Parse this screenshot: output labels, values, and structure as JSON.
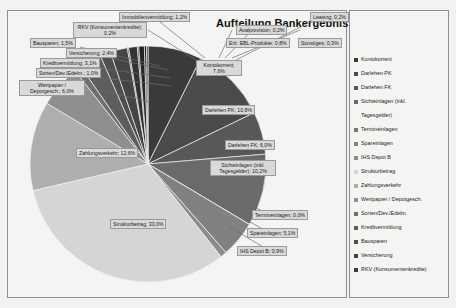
{
  "chart": {
    "title": "Aufteilung Bankergebnis"
  },
  "chart_data": {
    "type": "pie",
    "title": "Aufteilung Bankergebnis",
    "xlabel": "",
    "ylabel": "",
    "value_suffix": "%",
    "legend_position": "right",
    "grid": false,
    "categories": [
      "Kontokorrent",
      "Darlehen PK",
      "Darlehen FK",
      "Sichteinlagen (inkl. Tagesgelder)",
      "Termineinlagen",
      "Spareinlagen",
      "IHS Depot B",
      "Strukturbetrag",
      "Zahlungsverkehr",
      "Wertpapier / Depotgesch.",
      "Sorten/Dev./Edelm.",
      "Kreditvermittlung",
      "Bausparen",
      "Versicherung",
      "RKV (Konsumentenkredite)",
      "Immobilienvermittlung",
      "Avalprovision",
      "Erlr. EBL-Produkte",
      "Sonstiges",
      "Leasing"
    ],
    "values": [
      7.6,
      10.8,
      6.0,
      10.2,
      0.0,
      5.1,
      0.9,
      33.0,
      12.6,
      6.0,
      1.0,
      3.1,
      1.5,
      2.4,
      0.2,
      1.2,
      0.2,
      0.8,
      0.3,
      0.2
    ],
    "slice_colors": [
      "#3a3a3a",
      "#4a4a4a",
      "#585858",
      "#6a6a6a",
      "#787878",
      "#818181",
      "#8c8c8c",
      "#d5d5d5",
      "#aeaeae",
      "#8f8f8f",
      "#6f6f6f",
      "#5d5d5d",
      "#4f4f4f",
      "#454545",
      "#3d3d3d",
      "#333333",
      "#2c2c2c",
      "#262626",
      "#1f1f1f",
      "#1a1a1a"
    ]
  },
  "labels": [
    {
      "id": "immobilienvermittlung",
      "text": "Immobilienvermittlung; 1,2%"
    },
    {
      "id": "avalprovision",
      "text": "Avalprovision; 0,2%"
    },
    {
      "id": "leasing",
      "text": "Leasing; 0,2%"
    },
    {
      "id": "rkv",
      "text": "RKV (Konsumentenkredite);",
      "text2": "0,2%"
    },
    {
      "id": "erlr-ebl",
      "text": "Erlr. EBL-Produkte; 0,8%"
    },
    {
      "id": "sonstiges",
      "text": "Sonstiges; 0,3%"
    },
    {
      "id": "bausparen",
      "text": "Bausparen; 1,5%"
    },
    {
      "id": "versicherung",
      "text": "Versicherung; 2,4%"
    },
    {
      "id": "kreditvermittlung",
      "text": "Kreditvermittlung; 3,1%"
    },
    {
      "id": "sorten",
      "text": "Sorten/Dev./Edelm.; 1,0%"
    },
    {
      "id": "wertpapier",
      "text": "Wertpapier /",
      "text2": "Depotgesch.; 6,0%"
    },
    {
      "id": "kontokorrent",
      "text": "Kontokorrent;",
      "text2": "7,6%"
    },
    {
      "id": "darlehen-pk",
      "text": "Darlehen PK; 10,8%"
    },
    {
      "id": "darlehen-fk",
      "text": "Darlehen FK; 6,0%"
    },
    {
      "id": "sichteinlagen",
      "text": "Sichteinlagen (inkl.",
      "text2": "Tagesgelder); 10,2%"
    },
    {
      "id": "zahlungsverkehr",
      "text": "Zahlungsverkehr; 12,6%"
    },
    {
      "id": "strukturbetrag",
      "text": "Strukturbetrag; 33,0%"
    },
    {
      "id": "termineinlagen",
      "text": "Termineinlagen; 0,0%"
    },
    {
      "id": "spareinlagen",
      "text": "Spareinlagen; 5,1%"
    },
    {
      "id": "ihs-depot-b",
      "text": "IHS Depot B; 0,9%"
    }
  ],
  "legend": {
    "items": [
      {
        "label": "Kontokorrent",
        "color": "#3a3a3a"
      },
      {
        "label": "Darlehen PK",
        "color": "#4a4a4a"
      },
      {
        "label": "Darlehen FK",
        "color": "#585858"
      },
      {
        "label": "Sichteinlagen (inkl.",
        "color": "#6a6a6a"
      },
      {
        "label": "Tagesgelder)",
        "color": "transparent"
      },
      {
        "label": "Termineinlagen",
        "color": "#787878"
      },
      {
        "label": "Spareinlagen",
        "color": "#818181"
      },
      {
        "label": "IHS Depot B",
        "color": "#8c8c8c"
      },
      {
        "label": "Strukturbetrag",
        "color": "#d5d5d5"
      },
      {
        "label": "Zahlungsverkehr",
        "color": "#aeaeae"
      },
      {
        "label": "Wertpapier / Depotgesch.",
        "color": "#8f8f8f"
      },
      {
        "label": "Sorten/Dev./Edelm.",
        "color": "#6f6f6f"
      },
      {
        "label": "Kreditvermittlung",
        "color": "#5d5d5d"
      },
      {
        "label": "Bausparen",
        "color": "#4f4f4f"
      },
      {
        "label": "Versicherung",
        "color": "#454545"
      },
      {
        "label": "RKV (Konsumentenkredite)",
        "color": "#3d3d3d"
      }
    ]
  }
}
